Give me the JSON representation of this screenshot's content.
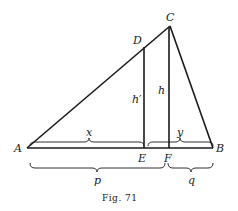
{
  "figure": {
    "caption": "Fig. 71",
    "points": {
      "A": "A",
      "B": "B",
      "C": "C",
      "D": "D",
      "E": "E",
      "F": "F"
    },
    "segment_labels": {
      "h_prime": "h′",
      "h": "h",
      "x": "x",
      "y": "y",
      "p": "p",
      "q": "q"
    }
  }
}
